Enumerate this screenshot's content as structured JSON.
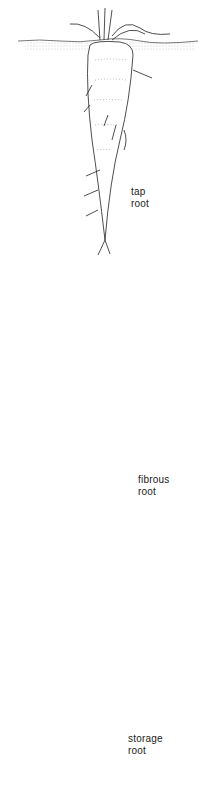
{
  "diagram": {
    "panels": [
      {
        "id": "tap",
        "label_line1": "tap",
        "label_line2": "root"
      },
      {
        "id": "fibrous",
        "label_line1": "fibrous",
        "label_line2": "root"
      },
      {
        "id": "storage",
        "label_line1": "storage",
        "label_line2": "root"
      }
    ],
    "colors": {
      "ink": "#222222",
      "soil": "#999999",
      "background": "#ffffff"
    }
  }
}
